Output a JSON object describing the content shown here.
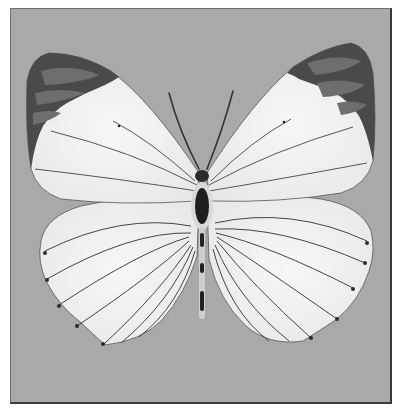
{
  "image": {
    "subject": "white butterfly specimen, dorsal view",
    "palette": {
      "background": "#a9a9a9",
      "frame_border": "#3a3a3a",
      "wing_white": "#f2f2f2",
      "wing_tip_dark": "#3c3c3c",
      "wing_tip_mid": "#6a6a6a",
      "vein": "#444444",
      "body": "#1e1e1e"
    }
  }
}
